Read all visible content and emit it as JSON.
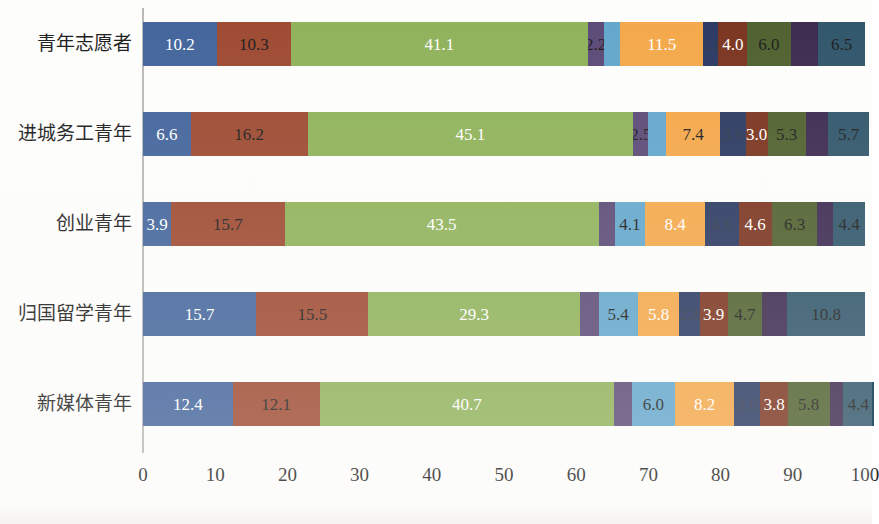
{
  "chart_data": {
    "type": "bar",
    "orientation": "horizontal",
    "stacked": true,
    "title": "",
    "xlabel": "",
    "ylabel": "",
    "xlim": [
      0,
      100
    ],
    "grid": false,
    "legend": "none",
    "xticks": [
      "0",
      "10",
      "20",
      "30",
      "40",
      "50",
      "60",
      "70",
      "80",
      "90",
      "100"
    ],
    "xtick_values": [
      0,
      10,
      20,
      30,
      40,
      50,
      60,
      70,
      80,
      90,
      100
    ],
    "categories": [
      "青年志愿者",
      "进城务工青年",
      "创业青年",
      "归国留学青年",
      "新媒体青年"
    ],
    "series": [
      {
        "name": "s1",
        "color": "#43659c",
        "values": [
          10.2,
          6.6,
          3.9,
          15.7,
          12.4
        ]
      },
      {
        "name": "s2",
        "color": "#9e4a32",
        "values": [
          10.3,
          16.2,
          15.7,
          15.5,
          12.1
        ]
      },
      {
        "name": "s3",
        "color": "#8fb25a",
        "values": [
          41.1,
          45.1,
          43.5,
          29.3,
          40.7
        ]
      },
      {
        "name": "s4",
        "color": "#5b4a77",
        "values": [
          2.2,
          2.1,
          2.3,
          2.6,
          2.5
        ]
      },
      {
        "name": "s5",
        "color": "#63a7cc",
        "values": [
          2.3,
          2.5,
          4.1,
          5.4,
          6.0
        ]
      },
      {
        "name": "s6",
        "color": "#f4a84a",
        "values": [
          11.5,
          7.4,
          8.4,
          5.8,
          8.2
        ]
      },
      {
        "name": "s7",
        "color": "#2b3a63",
        "values": [
          2.1,
          3.6,
          4.6,
          2.8,
          3.6
        ]
      },
      {
        "name": "s8",
        "color": "#7b3520",
        "values": [
          4.0,
          3.0,
          4.6,
          3.9,
          3.8
        ]
      },
      {
        "name": "s9",
        "color": "#4f612f",
        "values": [
          6.0,
          5.3,
          6.3,
          4.7,
          5.8
        ]
      },
      {
        "name": "s10",
        "color": "#3c2a50",
        "values": [
          3.8,
          3.1,
          2.2,
          3.5,
          1.8
        ]
      },
      {
        "name": "s11",
        "color": "#30566b",
        "values": [
          6.5,
          5.7,
          4.4,
          10.8,
          4.4
        ]
      }
    ],
    "bar_labels": [
      [
        {
          "text": "10.2",
          "tone": "light"
        },
        {
          "text": "10.3",
          "tone": "dark"
        },
        {
          "text": "41.1",
          "tone": "light"
        },
        {
          "text": "2.2",
          "tone": "dark"
        },
        {
          "text": "",
          "tone": "dark"
        },
        {
          "text": "11.5",
          "tone": "light"
        },
        {
          "text": "2.1",
          "tone": "faint"
        },
        {
          "text": "4.0",
          "tone": "light"
        },
        {
          "text": "6.0",
          "tone": "dark"
        },
        {
          "text": "",
          "tone": "dark"
        },
        {
          "text": "6.5",
          "tone": "dark"
        }
      ],
      [
        {
          "text": "6.6",
          "tone": "light"
        },
        {
          "text": "16.2",
          "tone": "dark"
        },
        {
          "text": "45.1",
          "tone": "light"
        },
        {
          "text": "2.5",
          "tone": "dark"
        },
        {
          "text": "",
          "tone": "dark"
        },
        {
          "text": "7.4",
          "tone": "dark"
        },
        {
          "text": "3.6",
          "tone": "faint"
        },
        {
          "text": "3.0",
          "tone": "light"
        },
        {
          "text": "5.3",
          "tone": "dark"
        },
        {
          "text": "",
          "tone": "dark"
        },
        {
          "text": "5.7",
          "tone": "dark"
        }
      ],
      [
        {
          "text": "3.9",
          "tone": "light"
        },
        {
          "text": "15.7",
          "tone": "dark"
        },
        {
          "text": "43.5",
          "tone": "light"
        },
        {
          "text": "",
          "tone": "dark"
        },
        {
          "text": "4.1",
          "tone": "dark"
        },
        {
          "text": "8.4",
          "tone": "light"
        },
        {
          "text": "4.6",
          "tone": "faint"
        },
        {
          "text": "4.6",
          "tone": "light"
        },
        {
          "text": "6.3",
          "tone": "dark"
        },
        {
          "text": "",
          "tone": "dark"
        },
        {
          "text": "4.4",
          "tone": "dark"
        }
      ],
      [
        {
          "text": "15.7",
          "tone": "light"
        },
        {
          "text": "15.5",
          "tone": "dark"
        },
        {
          "text": "29.3",
          "tone": "light"
        },
        {
          "text": "",
          "tone": "dark"
        },
        {
          "text": "5.4",
          "tone": "dark"
        },
        {
          "text": "5.8",
          "tone": "light"
        },
        {
          "text": "2.8",
          "tone": "faint"
        },
        {
          "text": "3.9",
          "tone": "light"
        },
        {
          "text": "4.7",
          "tone": "dark"
        },
        {
          "text": "",
          "tone": "dark"
        },
        {
          "text": "10.8",
          "tone": "dark"
        }
      ],
      [
        {
          "text": "12.4",
          "tone": "light"
        },
        {
          "text": "12.1",
          "tone": "dark"
        },
        {
          "text": "40.7",
          "tone": "light"
        },
        {
          "text": "",
          "tone": "dark"
        },
        {
          "text": "6.0",
          "tone": "dark"
        },
        {
          "text": "8.2",
          "tone": "light"
        },
        {
          "text": "3.6",
          "tone": "faint"
        },
        {
          "text": "3.8",
          "tone": "light"
        },
        {
          "text": "5.8",
          "tone": "dark"
        },
        {
          "text": "",
          "tone": "dark"
        },
        {
          "text": "4.4",
          "tone": "dark"
        }
      ]
    ]
  }
}
